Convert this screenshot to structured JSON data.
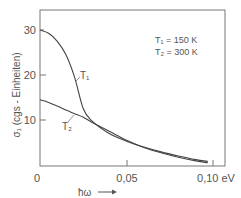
{
  "chart_data": {
    "type": "line",
    "title": "",
    "xlabel": "ħω",
    "xunit": "eV",
    "ylabel": "σ₁ (cgs - Einheiten)",
    "xlim": [
      0,
      0.105
    ],
    "ylim": [
      0,
      34
    ],
    "x_ticks": [
      {
        "value": 0,
        "label": "0"
      },
      {
        "value": 0.05,
        "label": "0,05"
      },
      {
        "value": 0.1,
        "label": "0,10 eV"
      }
    ],
    "y_ticks": [
      {
        "value": 10,
        "label": "10"
      },
      {
        "value": 20,
        "label": "20"
      },
      {
        "value": 30,
        "label": "30"
      }
    ],
    "grid": false,
    "legend_position": "upper right (text annotation)",
    "annotations": [
      "T₁ = 150 K",
      "T₂ = 300 K"
    ],
    "series": [
      {
        "name": "T1",
        "label": "T₁",
        "temperature": "150 K",
        "x": [
          0,
          0.005,
          0.01,
          0.015,
          0.02,
          0.025,
          0.03,
          0.04,
          0.05,
          0.06,
          0.07,
          0.08,
          0.09,
          0.097
        ],
        "y": [
          30,
          29.3,
          27.5,
          24.5,
          19.5,
          12.5,
          9.8,
          7.0,
          5.3,
          4.0,
          2.9,
          2.0,
          1.2,
          0.8
        ]
      },
      {
        "name": "T2",
        "label": "T₂",
        "temperature": "300 K",
        "x": [
          0,
          0.005,
          0.01,
          0.015,
          0.02,
          0.025,
          0.03,
          0.04,
          0.05,
          0.06,
          0.07,
          0.08,
          0.09,
          0.097
        ],
        "y": [
          14.5,
          13.9,
          13.1,
          12.2,
          11.4,
          10.6,
          9.5,
          7.5,
          5.5,
          3.9,
          2.7,
          1.7,
          0.9,
          0.5
        ]
      }
    ]
  },
  "legend": {
    "line1": "T₁ = 150 K",
    "line2": "T₂ = 300 K"
  },
  "axes": {
    "x_label_symbol": "ħω",
    "x_arrow": "→",
    "y_label": "σ₁ (cgs - Einheiten)",
    "x_tick_0": "0",
    "x_tick_1": "0,05",
    "x_tick_2": "0,10 eV",
    "y_tick_10": "10",
    "y_tick_20": "20",
    "y_tick_30": "30"
  },
  "curves": {
    "t1_label": "T₁",
    "t2_label": "T₂"
  }
}
